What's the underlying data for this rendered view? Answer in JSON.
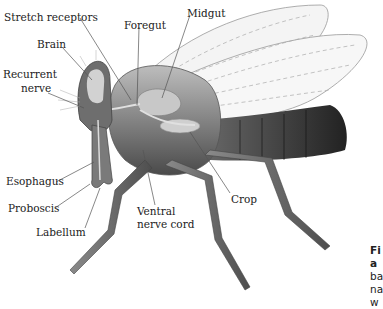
{
  "figure": {
    "labels": {
      "stretch_receptors": "Stretch receptors",
      "brain": "Brain",
      "foregut": "Foregut",
      "midgut": "Midgut",
      "recurrent_nerve_1": "Recurrent",
      "recurrent_nerve_2": "nerve",
      "esophagus": "Esophagus",
      "proboscis": "Proboscis",
      "labellum": "Labellum",
      "ventral_nerve_cord_1": "Ventral",
      "ventral_nerve_cord_2": "nerve cord",
      "crop": "Crop"
    },
    "caption_fragments": [
      "Fi",
      "a",
      "ba",
      "na",
      "w"
    ]
  }
}
